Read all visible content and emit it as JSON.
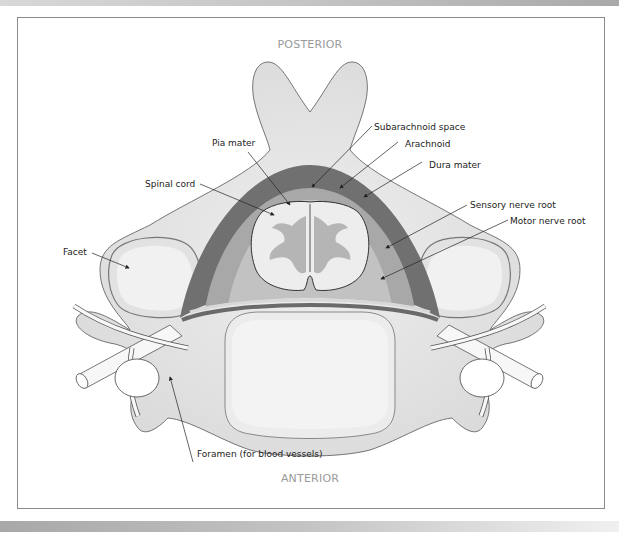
{
  "figure": {
    "orientation": {
      "top": "POSTERIOR",
      "bottom": "ANTERIOR"
    },
    "labels": [
      {
        "id": "pia-mater",
        "text": "Pia mater"
      },
      {
        "id": "spinal-cord",
        "text": "Spinal cord"
      },
      {
        "id": "subarachnoid-space",
        "text": "Subarachnoid space"
      },
      {
        "id": "arachnoid",
        "text": "Arachnoid"
      },
      {
        "id": "dura-mater",
        "text": "Dura mater"
      },
      {
        "id": "sensory-nerve-root",
        "text": "Sensory nerve root"
      },
      {
        "id": "motor-nerve-root",
        "text": "Motor nerve root"
      },
      {
        "id": "facet",
        "text": "Facet"
      },
      {
        "id": "foramen",
        "text": "Foramen (for blood vessels)"
      }
    ],
    "colors": {
      "bone": "#e6e6e6",
      "bone_outline": "#555555",
      "dura": "#707070",
      "arachnoid": "#a8a8a8",
      "subarachnoid": "#c2c2c2",
      "cord_white": "#eeeeee",
      "cord_grey": "#b5b5b5",
      "label_text": "#222222",
      "direction_text": "#9a9a9a"
    }
  }
}
